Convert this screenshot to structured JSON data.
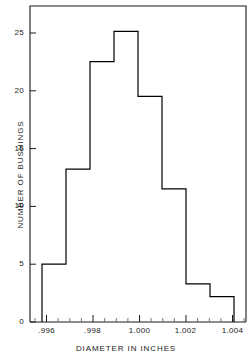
{
  "chart_data": {
    "type": "bar",
    "title": "",
    "subtitle": "",
    "xlabel": "DIAMETER IN INCHES",
    "ylabel": "NUMBER OF BUSHINGS",
    "grid": false,
    "legend": false,
    "legend_position": "none",
    "xlim": [
      0.9955,
      1.0045
    ],
    "ylim": [
      0,
      27.3
    ],
    "x_major_ticks": [
      0.996,
      0.998,
      1.0,
      1.002,
      1.004
    ],
    "x_major_tick_labels": [
      ".996",
      ".998",
      "1.000",
      "1.002",
      "1.004"
    ],
    "x_minor_tick_step": 0.0005,
    "y_ticks": [
      0,
      5,
      10,
      15,
      20,
      25
    ],
    "y_tick_labels": [
      "0",
      "5",
      "10",
      "15",
      "20",
      "25"
    ],
    "bin_width": 0.001,
    "bin_edges": [
      0.996,
      0.997,
      0.998,
      0.999,
      1.0,
      1.001,
      1.002,
      1.003,
      1.004
    ],
    "categories": [
      ".996-.997",
      ".997-.998",
      ".998-.999",
      ".999-1.000",
      "1.000-1.001",
      "1.001-1.002",
      "1.002-1.003",
      "1.003-1.004"
    ],
    "values": [
      5.0,
      13.2,
      22.5,
      25.1,
      19.5,
      11.5,
      3.3,
      2.2
    ],
    "bar_fill": "#ffffff",
    "bar_stroke": "#000000",
    "axis_color": "#000000",
    "text_color": "#1a1a1a"
  }
}
